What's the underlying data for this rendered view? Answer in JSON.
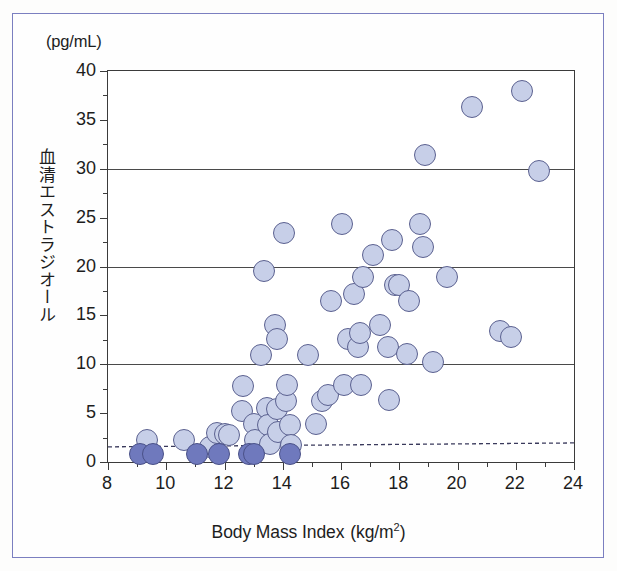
{
  "figure": {
    "unit_caption": "(pg/mL)",
    "y_axis_title": "血清エストラジオール",
    "x_axis_title_main": "Body Mass Index",
    "x_axis_title_unit_pre": "(kg/m",
    "x_axis_title_unit_sup": "2",
    "x_axis_title_unit_post": ")",
    "frame_color": "#7b7fc0",
    "marker_open_fill": "#c7cfe8",
    "marker_filled_fill": "#6f79bd",
    "marker_edge": "#5b6190",
    "axis_color": "#3b3b3b"
  },
  "chart_data": {
    "type": "scatter",
    "title": "",
    "xlabel": "Body Mass Index (kg/m2)",
    "ylabel": "血清エストラジオール (pg/mL)",
    "xlim": [
      8,
      24
    ],
    "ylim": [
      0,
      40
    ],
    "xticks": [
      8,
      10,
      12,
      14,
      16,
      18,
      20,
      22,
      24
    ],
    "xtick_labels": [
      "8",
      "10",
      "12",
      "14",
      "16",
      "18",
      "20",
      "22",
      "24"
    ],
    "xminorticks": [
      9,
      11,
      13,
      15,
      17,
      19,
      21,
      23
    ],
    "yticks": [
      0,
      5,
      10,
      15,
      20,
      25,
      30,
      35,
      40
    ],
    "ytick_labels": [
      "0",
      "5",
      "10",
      "15",
      "20",
      "25",
      "30",
      "35",
      "40"
    ],
    "gridlines_y": [
      10,
      20,
      30
    ],
    "grid": "horizontal-major-only",
    "legend": "none",
    "threshold_line": {
      "style": "dashed",
      "label": "",
      "y_left": 1.55,
      "y_right": 1.95
    },
    "series": [
      {
        "name": "detectable",
        "marker": "open-circle",
        "points": [
          [
            9.35,
            2.25
          ],
          [
            10.6,
            2.2
          ],
          [
            11.5,
            1.5
          ],
          [
            11.75,
            2.95
          ],
          [
            12.0,
            2.85
          ],
          [
            12.15,
            2.8
          ],
          [
            12.6,
            5.2
          ],
          [
            12.65,
            7.75
          ],
          [
            13.0,
            3.85
          ],
          [
            13.05,
            2.3
          ],
          [
            13.25,
            10.9
          ],
          [
            13.35,
            19.5
          ],
          [
            13.45,
            5.5
          ],
          [
            13.5,
            3.8
          ],
          [
            13.55,
            1.85
          ],
          [
            13.75,
            14.0
          ],
          [
            13.8,
            12.6
          ],
          [
            13.8,
            5.4
          ],
          [
            13.85,
            3.1
          ],
          [
            14.05,
            23.4
          ],
          [
            14.1,
            6.2
          ],
          [
            14.15,
            7.9
          ],
          [
            14.25,
            3.8
          ],
          [
            14.3,
            1.7
          ],
          [
            14.85,
            10.9
          ],
          [
            15.15,
            3.85
          ],
          [
            15.35,
            6.2
          ],
          [
            15.55,
            6.9
          ],
          [
            15.65,
            16.5
          ],
          [
            16.05,
            24.3
          ],
          [
            16.1,
            7.9
          ],
          [
            16.25,
            12.6
          ],
          [
            16.45,
            17.2
          ],
          [
            16.6,
            11.8
          ],
          [
            16.65,
            13.2
          ],
          [
            16.7,
            7.9
          ],
          [
            16.75,
            18.9
          ],
          [
            17.1,
            21.2
          ],
          [
            17.35,
            14.0
          ],
          [
            17.6,
            11.8
          ],
          [
            17.65,
            6.3
          ],
          [
            17.75,
            22.7
          ],
          [
            17.85,
            18.1
          ],
          [
            18.0,
            18.1
          ],
          [
            18.25,
            11.0
          ],
          [
            18.35,
            16.5
          ],
          [
            18.7,
            24.3
          ],
          [
            18.8,
            22.0
          ],
          [
            18.9,
            31.4
          ],
          [
            19.15,
            10.2
          ],
          [
            19.65,
            18.9
          ],
          [
            20.5,
            36.3
          ],
          [
            21.45,
            13.4
          ],
          [
            21.85,
            12.8
          ],
          [
            22.2,
            38.0
          ],
          [
            22.8,
            29.8
          ]
        ]
      },
      {
        "name": "below-detection-limit",
        "marker": "filled-circle",
        "points": [
          [
            9.1,
            0.85
          ],
          [
            9.55,
            0.85
          ],
          [
            11.05,
            0.85
          ],
          [
            11.8,
            0.85
          ],
          [
            12.85,
            0.85
          ],
          [
            13.0,
            0.85
          ],
          [
            14.25,
            0.85
          ]
        ]
      }
    ]
  }
}
